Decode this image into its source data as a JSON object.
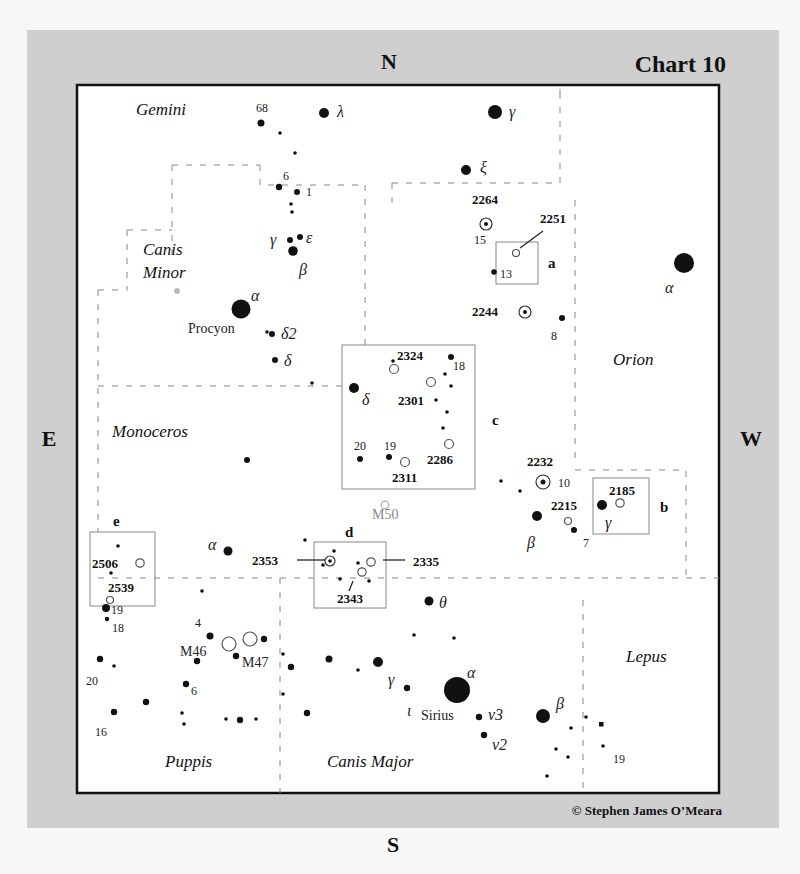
{
  "chart": {
    "title": "Chart 10",
    "copyright": "© Stephen James O’Meara",
    "compass": {
      "north": "N",
      "south": "S",
      "east": "E",
      "west": "W"
    },
    "colors": {
      "panel": "#cfcfcf",
      "frame": "#111111",
      "map_bg": "#ffffff",
      "boundary": "#888888",
      "star": "#111111"
    }
  },
  "constellations": [
    {
      "label": "Gemini",
      "x": 136,
      "y": 115
    },
    {
      "label": "Canis",
      "x": 143,
      "y": 249
    },
    {
      "label": "Minor",
      "x": 143,
      "y": 274
    },
    {
      "label": "Orion",
      "x": 613,
      "y": 365
    },
    {
      "label": "Monoceros",
      "x": 112,
      "y": 437
    },
    {
      "label": "Lepus",
      "x": 626,
      "y": 662
    },
    {
      "label": "Puppis",
      "x": 165,
      "y": 767
    },
    {
      "label": "Canis Major",
      "x": 327,
      "y": 767
    }
  ],
  "named_stars": [
    {
      "label": "Procyon",
      "x": 188,
      "y": 330
    },
    {
      "label": "Sirius",
      "x": 421,
      "y": 715
    }
  ],
  "messier": [
    {
      "label": "M46",
      "x": 180,
      "y": 656,
      "style": "dark"
    },
    {
      "label": "M47",
      "x": 242,
      "y": 667,
      "style": "dark"
    },
    {
      "label": "M50",
      "x": 372,
      "y": 519,
      "style": "grey"
    }
  ],
  "ngc_labels": [
    {
      "label": "2264",
      "x": 472,
      "y": 204
    },
    {
      "label": "2251",
      "x": 540,
      "y": 223
    },
    {
      "label": "2244",
      "x": 472,
      "y": 316
    },
    {
      "label": "2324",
      "x": 397,
      "y": 360
    },
    {
      "label": "2301",
      "x": 398,
      "y": 405
    },
    {
      "label": "2286",
      "x": 427,
      "y": 464
    },
    {
      "label": "2311",
      "x": 392,
      "y": 482
    },
    {
      "label": "2232",
      "x": 527,
      "y": 466
    },
    {
      "label": "2185",
      "x": 609,
      "y": 495
    },
    {
      "label": "2215",
      "x": 551,
      "y": 510
    },
    {
      "label": "2353",
      "x": 252,
      "y": 560
    },
    {
      "label": "2335",
      "x": 413,
      "y": 566
    },
    {
      "label": "2343",
      "x": 337,
      "y": 603
    },
    {
      "label": "2506",
      "x": 92,
      "y": 566
    },
    {
      "label": "2539",
      "x": 108,
      "y": 592
    }
  ],
  "greek_labels": [
    {
      "label": "λ",
      "x": 337,
      "y": 117
    },
    {
      "label": "γ",
      "x": 509,
      "y": 117
    },
    {
      "label": "ξ",
      "x": 480,
      "y": 173
    },
    {
      "label": "γ",
      "x": 270,
      "y": 243
    },
    {
      "label": "ε",
      "x": 306,
      "y": 243
    },
    {
      "label": "β",
      "x": 299,
      "y": 273
    },
    {
      "label": "α",
      "x": 251,
      "y": 301
    },
    {
      "label": "δ2",
      "x": 281,
      "y": 337
    },
    {
      "label": "δ",
      "x": 284,
      "y": 364
    },
    {
      "label": "δ",
      "x": 362,
      "y": 403
    },
    {
      "label": "α",
      "x": 665,
      "y": 291
    },
    {
      "label": "β",
      "x": 527,
      "y": 546
    },
    {
      "label": "γ",
      "x": 605,
      "y": 526
    },
    {
      "label": "α",
      "x": 208,
      "y": 548
    },
    {
      "label": "θ",
      "x": 439,
      "y": 606
    },
    {
      "label": "γ",
      "x": 388,
      "y": 683
    },
    {
      "label": "ι",
      "x": 407,
      "y": 714
    },
    {
      "label": "α",
      "x": 467,
      "y": 676
    },
    {
      "label": "ν3",
      "x": 488,
      "y": 715
    },
    {
      "label": "ν2",
      "x": 492,
      "y": 746
    },
    {
      "label": "β",
      "x": 556,
      "y": 707
    }
  ],
  "number_labels": [
    {
      "label": "68",
      "x": 256,
      "y": 112
    },
    {
      "label": "6",
      "x": 283,
      "y": 178
    },
    {
      "label": "1",
      "x": 306,
      "y": 194
    },
    {
      "label": "15",
      "x": 474,
      "y": 242
    },
    {
      "label": "13",
      "x": 500,
      "y": 276
    },
    {
      "label": "8",
      "x": 551,
      "y": 340
    },
    {
      "label": "18",
      "x": 453,
      "y": 370
    },
    {
      "label": "20",
      "x": 354,
      "y": 450
    },
    {
      "label": "19",
      "x": 384,
      "y": 450
    },
    {
      "label": "10",
      "x": 558,
      "y": 485
    },
    {
      "label": "7",
      "x": 583,
      "y": 547
    },
    {
      "label": "19",
      "x": 111,
      "y": 614
    },
    {
      "label": "18",
      "x": 112,
      "y": 632
    },
    {
      "label": "4",
      "x": 195,
      "y": 627
    },
    {
      "label": "20",
      "x": 86,
      "y": 685
    },
    {
      "label": "6",
      "x": 191,
      "y": 695
    },
    {
      "label": "16",
      "x": 95,
      "y": 736
    },
    {
      "label": "19",
      "x": 613,
      "y": 763
    }
  ],
  "finder_boxes": [
    {
      "id": "a",
      "label": "a",
      "x": 496,
      "y": 242,
      "w": 42,
      "h": 42,
      "label_x": 548,
      "label_y": 268
    },
    {
      "id": "b",
      "label": "b",
      "x": 593,
      "y": 478,
      "w": 56,
      "h": 56,
      "label_x": 660,
      "label_y": 512
    },
    {
      "id": "c",
      "label": "c",
      "x": 342,
      "y": 345,
      "w": 133,
      "h": 144,
      "label_x": 492,
      "label_y": 425
    },
    {
      "id": "d",
      "label": "d",
      "x": 314,
      "y": 542,
      "w": 72,
      "h": 66,
      "label_x": 345,
      "label_y": 537
    },
    {
      "id": "e",
      "label": "e",
      "x": 90,
      "y": 532,
      "w": 65,
      "h": 74,
      "label_x": 113,
      "label_y": 526
    }
  ],
  "legend": {
    "star": "filled dot (size ∝ brightness)",
    "open_cluster": "open circle",
    "nebula_cluster": "circled dot"
  }
}
